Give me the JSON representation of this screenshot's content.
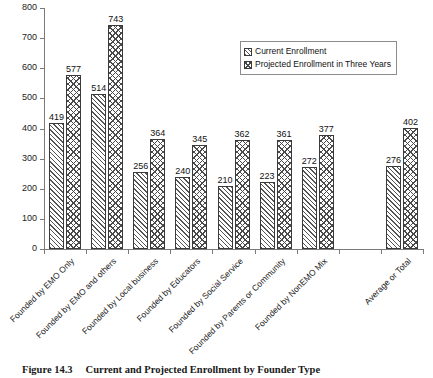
{
  "caption": {
    "number": "Figure 14.3",
    "text": "Current and Projected Enrollment by Founder Type"
  },
  "legend": {
    "position": "inside-top-right",
    "entries": [
      {
        "label": "Current Enrollment",
        "pattern": "diagonal-hatch"
      },
      {
        "label": "Projected Enrollment in Three Years",
        "pattern": "cross-hatch"
      }
    ]
  },
  "chart_data": {
    "type": "bar",
    "title": "Current and Projected Enrollment by Founder Type",
    "xlabel": "",
    "ylabel": "",
    "ylim": [
      0,
      800
    ],
    "yticks": [
      0,
      100,
      200,
      300,
      400,
      500,
      600,
      700,
      800
    ],
    "ytick_labels": [
      "0",
      "100",
      "200",
      "300",
      "400",
      "500",
      "600",
      "700",
      "800"
    ],
    "grid": false,
    "legend_position": "upper right",
    "data_labels": true,
    "categories": [
      "Founded by EMO Only",
      "Founded by EMO and others",
      "Founded by Local business",
      "Founded by Educators",
      "Founded by Social Service",
      "Founded by Parents or Community",
      "Founded by NonEMO Mix",
      "",
      "Average or Total"
    ],
    "series": [
      {
        "name": "Current Enrollment",
        "values": [
          419,
          514,
          256,
          240,
          210,
          223,
          272,
          null,
          276
        ]
      },
      {
        "name": "Projected Enrollment in Three Years",
        "values": [
          577,
          743,
          364,
          345,
          362,
          361,
          377,
          null,
          402
        ]
      }
    ]
  }
}
